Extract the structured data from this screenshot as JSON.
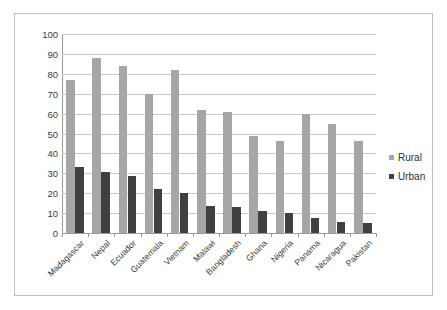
{
  "chart_data": {
    "type": "bar",
    "title": "",
    "subtitle": "",
    "xlabel": "",
    "ylabel": "",
    "ylim": [
      0,
      100
    ],
    "yticks": [
      "0",
      "10",
      "20",
      "30",
      "40",
      "50",
      "60",
      "70",
      "80",
      "90",
      "100"
    ],
    "ytick_values": [
      0,
      10,
      20,
      30,
      40,
      50,
      60,
      70,
      80,
      90,
      100
    ],
    "grid": true,
    "legend_position": "right",
    "categories": [
      "Madagascar",
      "Nepal",
      "Ecuador",
      "Guatemala",
      "Vietnam",
      "Malawi",
      "Bangladesh",
      "Ghana",
      "Nigeria",
      "Panama",
      "Nicaragua",
      "Pakistan"
    ],
    "series": [
      {
        "name": "Rural",
        "color": "#a6a6a6",
        "values": [
          77,
          88,
          84,
          70,
          82,
          62,
          61,
          49,
          46,
          60,
          55,
          46
        ]
      },
      {
        "name": "Urban",
        "color": "#404040",
        "values": [
          33,
          30.5,
          28.5,
          22,
          20,
          13.5,
          13,
          11,
          10,
          7.5,
          5.5,
          5
        ]
      }
    ]
  },
  "legend": {
    "items": [
      {
        "label": "Rural",
        "color": "#a6a6a6"
      },
      {
        "label": "Urban",
        "color": "#404040"
      }
    ]
  },
  "colors": {
    "rural": "#a6a6a6",
    "urban": "#404040",
    "gridline": "#c8c8c8",
    "axis": "#9a9a9a",
    "frame": "#bfbfbf",
    "text": "#3b3b3b",
    "background": "#ffffff"
  }
}
